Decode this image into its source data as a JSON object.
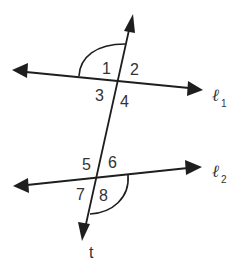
{
  "diagram": {
    "type": "parallel-lines-cut-by-transversal",
    "lines": {
      "l1": {
        "name": "ℓ",
        "subscript": "1"
      },
      "l2": {
        "name": "ℓ",
        "subscript": "2"
      },
      "transversal": {
        "name": "t"
      }
    },
    "angles": [
      "1",
      "2",
      "3",
      "4",
      "5",
      "6",
      "7",
      "8"
    ],
    "marked_arcs": [
      {
        "angle": "1",
        "description": "arc marking angle 1 (upper-left at l1)"
      },
      {
        "angle": "8",
        "description": "arc marking angle 8 (lower-right at l2)"
      }
    ],
    "stroke_color": "#1e1e1e",
    "text_color": "#333333"
  }
}
